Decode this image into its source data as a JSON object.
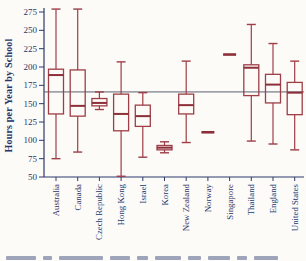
{
  "figure": {
    "ylabel": "Hours per Year by School",
    "colors": {
      "box_stroke": "#9e3e46",
      "median_stroke": "#8d2f38",
      "axis": "#2c3a6a",
      "tick_text": "#27356a",
      "reference_line": "#5a5f6e",
      "background": "#fcfbf8"
    }
  },
  "chart_data": {
    "type": "boxplot",
    "title": "",
    "xlabel": "",
    "ylabel": "Hours per Year by School",
    "ylim": [
      50,
      282
    ],
    "yticks": [
      50,
      75,
      100,
      125,
      150,
      175,
      200,
      225,
      250,
      275
    ],
    "grid": false,
    "legend": null,
    "reference_line": 166,
    "categories": [
      "Australia",
      "Canada",
      "Czech Republic",
      "Hong Kong",
      "Israel",
      "Korea",
      "New Zealand",
      "Norway",
      "Singapore",
      "Thailand",
      "England",
      "United States"
    ],
    "stats": [
      {
        "min": 75,
        "q1": 136,
        "median": 189,
        "q3": 197,
        "max": 279,
        "collapsed": false
      },
      {
        "min": 84,
        "q1": 133,
        "median": 147,
        "q3": 196,
        "max": 279,
        "collapsed": false
      },
      {
        "min": 142,
        "q1": 147,
        "median": 151,
        "q3": 157,
        "max": 166,
        "collapsed": false
      },
      {
        "min": 51,
        "q1": 113,
        "median": 136,
        "q3": 163,
        "max": 207,
        "collapsed": false
      },
      {
        "min": 77,
        "q1": 119,
        "median": 133,
        "q3": 148,
        "max": 165,
        "collapsed": false
      },
      {
        "min": 83,
        "q1": 87,
        "median": 90,
        "q3": 93,
        "max": 98,
        "collapsed": false
      },
      {
        "min": 97,
        "q1": 136,
        "median": 148,
        "q3": 163,
        "max": 208,
        "collapsed": false
      },
      {
        "min": 111,
        "q1": 111,
        "median": 111,
        "q3": 111,
        "max": 111,
        "collapsed": true
      },
      {
        "min": 217,
        "q1": 217,
        "median": 217,
        "q3": 217,
        "max": 217,
        "collapsed": true
      },
      {
        "min": 99,
        "q1": 161,
        "median": 199,
        "q3": 203,
        "max": 258,
        "collapsed": false
      },
      {
        "min": 95,
        "q1": 151,
        "median": 176,
        "q3": 190,
        "max": 232,
        "collapsed": false
      },
      {
        "min": 87,
        "q1": 135,
        "median": 165,
        "q3": 179,
        "max": 208,
        "collapsed": false
      }
    ]
  }
}
